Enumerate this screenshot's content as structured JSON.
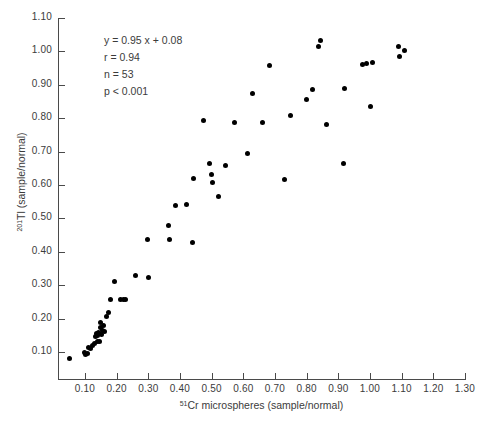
{
  "chart_data": {
    "type": "scatter",
    "title": "",
    "xlabel": "51Cr microspheres (sample/normal)",
    "ylabel": "201Tl (sample/normal)",
    "xlabel_sup": "51",
    "xlabel_rest": "Cr microspheres (sample/normal)",
    "ylabel_sup": "201",
    "ylabel_rest": "Tl (sample/normal)",
    "xlim": [
      0.0,
      1.3
    ],
    "ylim": [
      0.0,
      1.1
    ],
    "grid": false,
    "legend": "none",
    "marker_color": "#000000",
    "axis_color": "#4a4a4a",
    "xticks": [
      "0.10",
      "0.20",
      "0.30",
      "0.40",
      "0.50",
      "0.60",
      "0.70",
      "0.80",
      "0.90",
      "1.00",
      "1.10",
      "1.20",
      "1.30"
    ],
    "xtick_values": [
      0.1,
      0.2,
      0.3,
      0.4,
      0.5,
      0.6,
      0.7,
      0.8,
      0.9,
      1.0,
      1.1,
      1.2,
      1.3
    ],
    "yticks": [
      "0.10",
      "0.20",
      "0.30",
      "0.40",
      "0.50",
      "0.60",
      "0.70",
      "0.80",
      "0.90",
      "1.00",
      "1.10"
    ],
    "ytick_values": [
      0.1,
      0.2,
      0.3,
      0.4,
      0.5,
      0.6,
      0.7,
      0.8,
      0.9,
      1.0,
      1.1
    ],
    "annotations": [
      "y = 0.95 x  + 0.08",
      "r = 0.94",
      "n = 53",
      "p < 0.001"
    ],
    "regression": {
      "slope": 0.95,
      "intercept": 0.08,
      "r": 0.94,
      "n": 53,
      "p": "< 0.001"
    },
    "x": [
      0.05,
      0.098,
      0.103,
      0.108,
      0.112,
      0.118,
      0.124,
      0.129,
      0.133,
      0.136,
      0.138,
      0.14,
      0.142,
      0.145,
      0.148,
      0.15,
      0.152,
      0.155,
      0.158,
      0.162,
      0.168,
      0.175,
      0.182,
      0.192,
      0.212,
      0.222,
      0.228,
      0.26,
      0.297,
      0.302,
      0.363,
      0.368,
      0.385,
      0.42,
      0.44,
      0.443,
      0.473,
      0.492,
      0.5,
      0.503,
      0.52,
      0.543,
      0.572,
      0.612,
      0.628,
      0.662,
      0.683,
      0.73,
      0.75,
      0.8,
      0.818,
      0.838,
      0.845,
      0.862,
      0.915,
      0.92,
      0.975,
      0.99,
      1.0,
      1.008,
      1.09,
      1.092,
      1.11
    ],
    "y": [
      0.082,
      0.098,
      0.092,
      0.096,
      0.112,
      0.11,
      0.118,
      0.125,
      0.145,
      0.155,
      0.13,
      0.148,
      0.158,
      0.132,
      0.172,
      0.188,
      0.152,
      0.165,
      0.18,
      0.162,
      0.205,
      0.218,
      0.258,
      0.312,
      0.258,
      0.258,
      0.258,
      0.33,
      0.437,
      0.322,
      0.478,
      0.438,
      0.538,
      0.543,
      0.428,
      0.62,
      0.792,
      0.665,
      0.632,
      0.608,
      0.567,
      0.658,
      0.788,
      0.695,
      0.875,
      0.788,
      0.957,
      0.617,
      0.807,
      0.855,
      0.885,
      1.015,
      1.032,
      0.78,
      0.665,
      0.888,
      0.962,
      0.965,
      0.835,
      0.966,
      1.015,
      0.985,
      1.003
    ]
  }
}
